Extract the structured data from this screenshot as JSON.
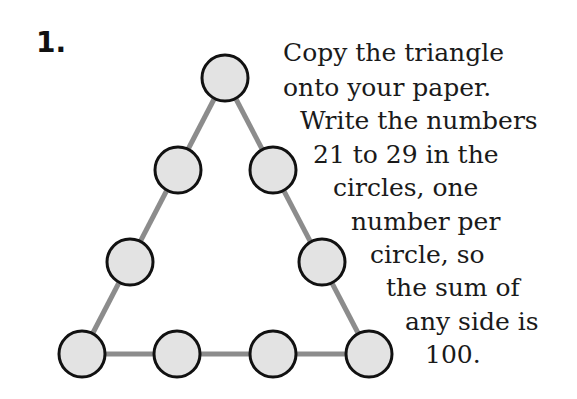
{
  "problem": {
    "number": "1.",
    "instructions": [
      "Copy the triangle",
      "onto your paper.",
      "Write the numbers",
      "21 to 29 in the",
      "circles, one",
      "number per",
      "circle, so",
      "the sum of",
      "any side is",
      "100."
    ]
  },
  "colors": {
    "circle_fill": "#e3e3e3",
    "circle_stroke": "#111111",
    "edge": "#8c8c8c"
  }
}
